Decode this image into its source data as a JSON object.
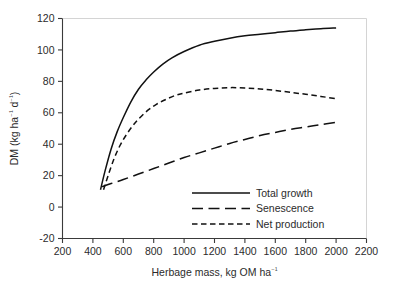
{
  "chart_data": {
    "type": "line",
    "title": "",
    "xlabel": "Herbage mass, kg OM ha⁻¹",
    "ylabel": "DM (kg ha⁻¹ d⁻¹)",
    "xlim": [
      200,
      2200
    ],
    "ylim": [
      -20,
      120
    ],
    "xticks": [
      200,
      400,
      600,
      800,
      1000,
      1200,
      1400,
      1600,
      1800,
      2000,
      2200
    ],
    "yticks": [
      -20,
      0,
      20,
      40,
      60,
      80,
      100,
      120
    ],
    "xtick_labels": [
      "200",
      "400",
      "600",
      "800",
      "1000",
      "1200",
      "1400",
      "1600",
      "1800",
      "2000",
      "2200"
    ],
    "ytick_labels": [
      "-20",
      "0",
      "20",
      "40",
      "60",
      "80",
      "100",
      "120"
    ],
    "grid": false,
    "legend_position": "inside-lower-center",
    "series": [
      {
        "name": "Total growth",
        "dash": "solid",
        "stroke_width": 1.5,
        "x": [
          450,
          480,
          520,
          560,
          600,
          650,
          700,
          750,
          800,
          860,
          920,
          1000,
          1100,
          1200,
          1300,
          1400,
          1500,
          1600,
          1700,
          1800,
          1900,
          2000
        ],
        "y": [
          11,
          23,
          37,
          48,
          57,
          67,
          75,
          81,
          86,
          91,
          95,
          99,
          103,
          105.5,
          107.5,
          109,
          110,
          111,
          112,
          112.8,
          113.5,
          114
        ]
      },
      {
        "name": "Senescence",
        "dash": "long-dash",
        "stroke_width": 1.5,
        "x": [
          460,
          520,
          600,
          700,
          800,
          900,
          1000,
          1100,
          1200,
          1300,
          1400,
          1500,
          1600,
          1700,
          1800,
          1900,
          2000
        ],
        "y": [
          13,
          15,
          17.5,
          21,
          24.5,
          28,
          31.5,
          34.5,
          37.5,
          40.5,
          43,
          45.5,
          47.5,
          49.5,
          51,
          52.5,
          54
        ]
      },
      {
        "name": "Net production",
        "dash": "short-dash",
        "stroke_width": 1.5,
        "x": [
          470,
          500,
          540,
          580,
          620,
          660,
          700,
          760,
          820,
          880,
          940,
          1000,
          1100,
          1200,
          1300,
          1400,
          1500,
          1600,
          1700,
          1800,
          1900,
          2000
        ],
        "y": [
          11,
          20,
          31,
          39.5,
          46,
          51.5,
          56,
          61.5,
          65.5,
          68.5,
          71,
          72.5,
          74.5,
          75.5,
          76,
          75.8,
          75.2,
          74.2,
          73,
          71.8,
          70.4,
          69
        ]
      }
    ],
    "legend_entries": [
      {
        "label": "Total growth",
        "dash": "solid"
      },
      {
        "label": "Senescence",
        "dash": "long-dash"
      },
      {
        "label": "Net production",
        "dash": "short-dash"
      }
    ]
  }
}
